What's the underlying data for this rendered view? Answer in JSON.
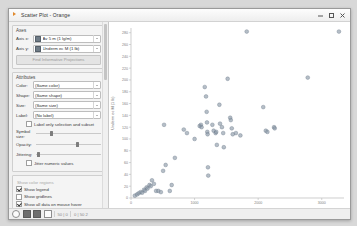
{
  "window": {
    "title": "Scatter Plot - Orange",
    "icon": "orange-widget-icon",
    "controls": {
      "minimize": "minimize-icon",
      "maximize": "maximize-icon",
      "close": "close-icon"
    }
  },
  "panel": {
    "axes": {
      "title": "Axes",
      "rows": [
        {
          "label": "Axis x:",
          "value": "Av 5 m (1 lg/m)"
        },
        {
          "label": "Axis y:",
          "value": "Underm  ec M (1 lb)"
        }
      ],
      "find_projections_button": "Find Informative Projections"
    },
    "attributes": {
      "title": "Attributes",
      "rows": [
        {
          "label": "Color:",
          "value": "(Same color)"
        },
        {
          "label": "Shape:",
          "value": "(Same shape)"
        },
        {
          "label": "Size:",
          "value": "(Same size)"
        },
        {
          "label": "Label:",
          "value": "(No label)"
        }
      ],
      "label_only_checkbox": {
        "text": "Label only selection and subset",
        "checked": false
      }
    },
    "sliders": [
      {
        "label": "Symbol size:",
        "value": 22
      },
      {
        "label": "Opacity:",
        "value": 62
      },
      {
        "label": "Jittering:",
        "value": 2
      }
    ],
    "jitter_checkbox": {
      "text": "Jitter numeric values",
      "checked": false
    },
    "plot_properties_title": "Show color regions",
    "checkboxes": [
      {
        "text": "Show legend",
        "checked": true
      },
      {
        "text": "Show gridlines",
        "checked": false
      },
      {
        "text": "Show all data on mouse hover",
        "checked": true
      }
    ],
    "zoom_select": {
      "label": "Zoom/Select",
      "tools": [
        "select-tool-icon",
        "pan-tool-icon",
        "zoom-tool-icon",
        "reset-zoom-icon"
      ]
    }
  },
  "statusbar": {
    "icons": [
      "help-icon",
      "save-icon",
      "report-icon",
      "settings-icon"
    ],
    "left_count": "50 | 0",
    "right_count": "0 | 50 2"
  },
  "chart_data": {
    "type": "scatter",
    "title": "",
    "xlabel": "Av 5 m (1 lg/m)",
    "ylabel": "Underm  ec M (1 lb)",
    "xlim": [
      0,
      3350
    ],
    "ylim": [
      0,
      288
    ],
    "xticks": [
      0,
      1000,
      2000,
      3000
    ],
    "yticks": [
      0,
      20,
      40,
      60,
      80,
      100,
      120,
      140,
      160,
      180,
      200,
      220,
      240,
      260,
      280
    ],
    "grid": false,
    "legend": false,
    "point_color": "#8796a5",
    "point_edge_color": "#6b7a88",
    "points": [
      [
        60,
        4
      ],
      [
        95,
        6
      ],
      [
        120,
        8
      ],
      [
        150,
        10
      ],
      [
        175,
        9
      ],
      [
        205,
        14
      ],
      [
        220,
        12
      ],
      [
        245,
        18
      ],
      [
        260,
        16
      ],
      [
        290,
        22
      ],
      [
        310,
        20
      ],
      [
        330,
        30
      ],
      [
        360,
        24
      ],
      [
        395,
        12
      ],
      [
        430,
        12
      ],
      [
        470,
        10
      ],
      [
        505,
        46
      ],
      [
        520,
        124
      ],
      [
        545,
        56
      ],
      [
        610,
        12
      ],
      [
        640,
        22
      ],
      [
        690,
        68
      ],
      [
        830,
        116
      ],
      [
        880,
        110
      ],
      [
        1000,
        100
      ],
      [
        1080,
        122
      ],
      [
        1100,
        124
      ],
      [
        1110,
        120
      ],
      [
        1160,
        188
      ],
      [
        1180,
        172
      ],
      [
        1190,
        146
      ],
      [
        1195,
        128
      ],
      [
        1200,
        112
      ],
      [
        1205,
        108
      ],
      [
        1210,
        52
      ],
      [
        1215,
        38
      ],
      [
        1280,
        124
      ],
      [
        1300,
        114
      ],
      [
        1330,
        110
      ],
      [
        1340,
        112
      ],
      [
        1350,
        90
      ],
      [
        1390,
        158
      ],
      [
        1400,
        126
      ],
      [
        1430,
        120
      ],
      [
        1450,
        110
      ],
      [
        1460,
        86
      ],
      [
        1520,
        202
      ],
      [
        1560,
        136
      ],
      [
        1570,
        132
      ],
      [
        1585,
        118
      ],
      [
        1600,
        108
      ],
      [
        1650,
        110
      ],
      [
        1720,
        106
      ],
      [
        1820,
        282
      ],
      [
        2080,
        154
      ],
      [
        2120,
        114
      ],
      [
        2145,
        112
      ],
      [
        2250,
        120
      ],
      [
        2260,
        118
      ],
      [
        2780,
        204
      ],
      [
        3270,
        282
      ]
    ]
  }
}
